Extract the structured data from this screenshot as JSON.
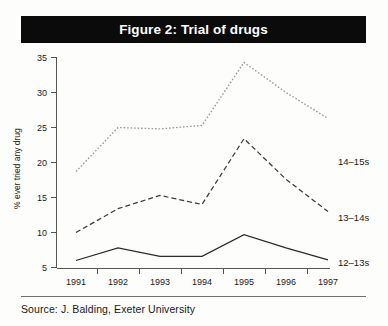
{
  "figure": {
    "title": "Figure 2: Trial of drugs",
    "source": "Source: J. Balding, Exeter University"
  },
  "chart_data": {
    "type": "line",
    "title": "Figure 2: Trial of drugs",
    "xlabel": "",
    "ylabel": "% ever tried any drug",
    "x": [
      "1991",
      "1992",
      "1993",
      "1994",
      "1995",
      "1996",
      "1997"
    ],
    "categories": [
      "1991",
      "1992",
      "1993",
      "1994",
      "1995",
      "1996",
      "1997"
    ],
    "xlim": [
      "1991",
      "1997"
    ],
    "ylim": [
      0,
      35
    ],
    "yticks": [
      5,
      10,
      15,
      20,
      25,
      30,
      35
    ],
    "grid": false,
    "legend_position": "right-inline-labels",
    "series": [
      {
        "name": "14–15s",
        "style": "dotted",
        "color": "#9a9a9a",
        "values": [
          18.7,
          25.0,
          24.8,
          25.3,
          34.3,
          30.0,
          26.3
        ]
      },
      {
        "name": "13–14s",
        "style": "dashed",
        "color": "#3a3a3a",
        "values": [
          10.0,
          13.4,
          15.3,
          14.0,
          23.4,
          17.6,
          13.0
        ]
      },
      {
        "name": "12–13s",
        "style": "solid",
        "color": "#2b2b2b",
        "values": [
          6.0,
          7.8,
          6.6,
          6.6,
          9.7,
          7.8,
          6.1
        ]
      }
    ]
  },
  "axes": {
    "y_labels": [
      "35",
      "30",
      "25",
      "20",
      "15",
      "10",
      "5"
    ],
    "y_title": "% ever tried any drug",
    "x_labels": [
      "1991",
      "1992",
      "1993",
      "1994",
      "1995",
      "1996",
      "1997"
    ]
  },
  "series_labels": {
    "top": "14–15s",
    "middle": "13–14s",
    "bottom": "12–13s"
  }
}
